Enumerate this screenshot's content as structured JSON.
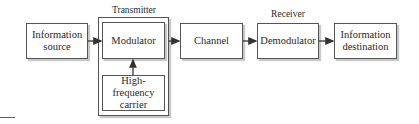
{
  "diagram": {
    "groups": {
      "transmitter": {
        "label": "Transmitter"
      },
      "receiver": {
        "label": "Receiver"
      }
    },
    "blocks": {
      "source": {
        "label": "Information source"
      },
      "modulator": {
        "label": "Modulator"
      },
      "carrier": {
        "label": "High-frequency carrier"
      },
      "channel": {
        "label": "Channel"
      },
      "demodulator": {
        "label": "Demodulator"
      },
      "destination": {
        "label": "Information destination"
      }
    },
    "connections": [
      {
        "from": "Information source",
        "to": "Modulator"
      },
      {
        "from": "High-frequency carrier",
        "to": "Modulator"
      },
      {
        "from": "Modulator",
        "to": "Channel"
      },
      {
        "from": "Channel",
        "to": "Demodulator"
      },
      {
        "from": "Demodulator",
        "to": "Information destination"
      }
    ],
    "colors": {
      "line": "#333333",
      "shadow": "#c8c8c8",
      "border": "#555555"
    }
  }
}
